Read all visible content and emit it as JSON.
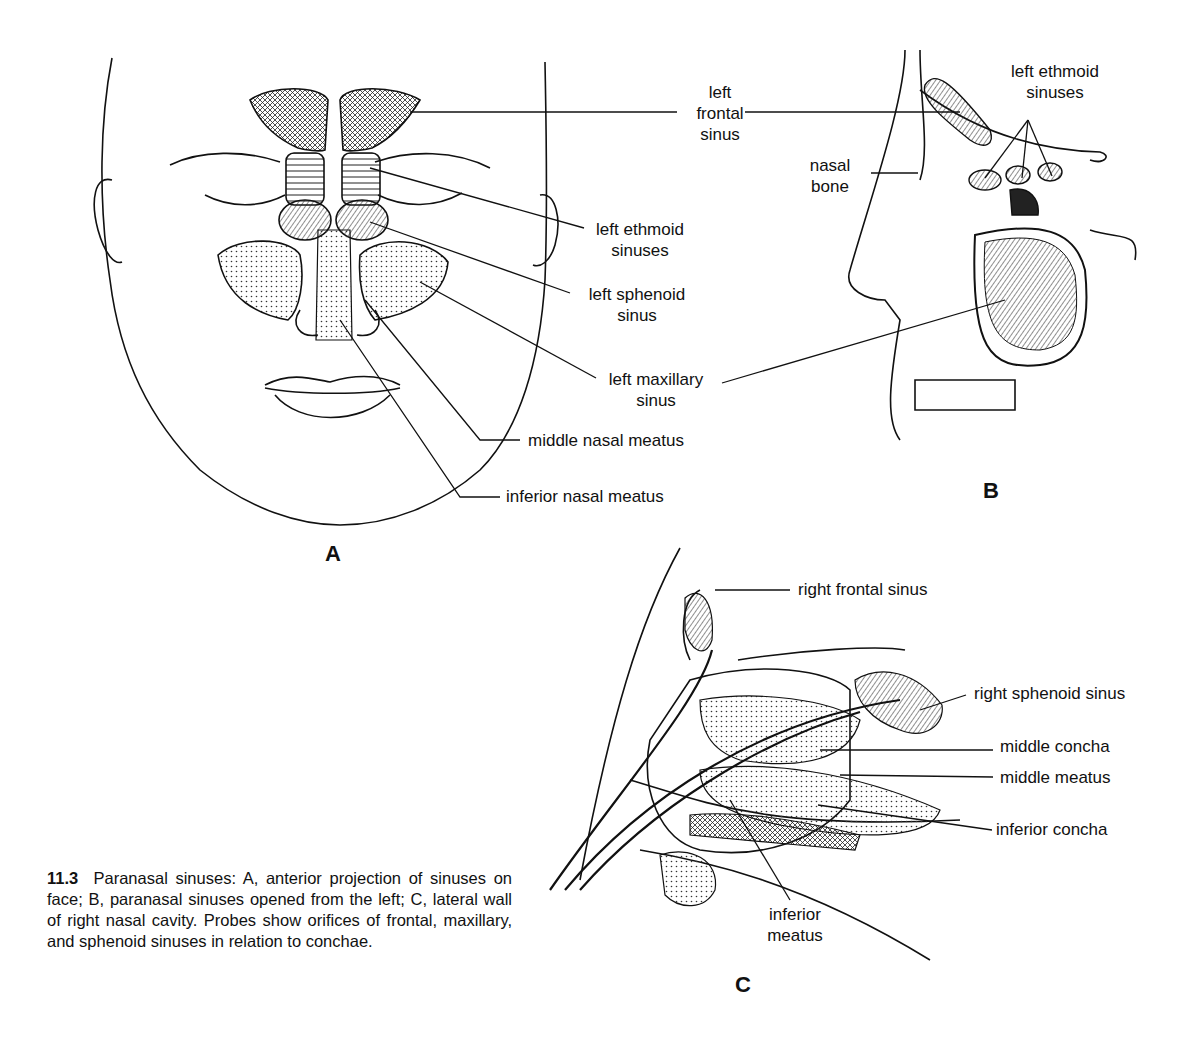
{
  "figure": {
    "number": "11.3",
    "caption": "Paranasal sinuses: A, anterior projection of sinuses on face; B, paranasal sinuses opened from the left; C, lateral wall of right nasal cavity. Probes show orifices of frontal, maxillary, and sphenoid sinuses in relation to conchae."
  },
  "panels": {
    "A": {
      "letter": "A",
      "labels": {
        "frontal_1": "left",
        "frontal_2": "frontal",
        "frontal_3": "sinus",
        "ethmoid_1": "left ethmoid",
        "ethmoid_2": "sinuses",
        "sphenoid_1": "left sphenoid",
        "sphenoid_2": "sinus",
        "maxillary_1": "left maxillary",
        "maxillary_2": "sinus",
        "middle_meatus": "middle nasal meatus",
        "inferior_meatus": "inferior nasal meatus"
      }
    },
    "B": {
      "letter": "B",
      "labels": {
        "ethmoid_1": "left ethmoid",
        "ethmoid_2": "sinuses",
        "nasal_bone_1": "nasal",
        "nasal_bone_2": "bone"
      }
    },
    "C": {
      "letter": "C",
      "labels": {
        "right_frontal": "right frontal sinus",
        "right_sphenoid": "right sphenoid sinus",
        "middle_concha": "middle concha",
        "middle_meatus": "middle meatus",
        "inferior_concha": "inferior concha",
        "inferior_meatus_1": "inferior",
        "inferior_meatus_2": "meatus"
      }
    }
  }
}
